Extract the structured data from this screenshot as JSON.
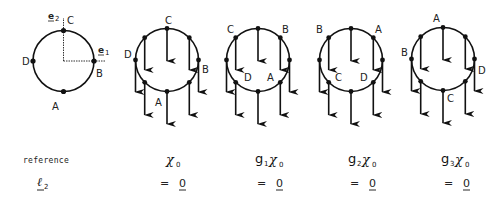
{
  "reference_diagram": {
    "labels": {
      "top": "C",
      "right": "B",
      "bottom": "A",
      "left": "D"
    },
    "axes": {
      "e1": "e",
      "e1_sub": "1",
      "e2": "e",
      "e2_sub": "2"
    }
  },
  "configurations": [
    {
      "id": "x0",
      "labels": {
        "top": "C",
        "right": "B",
        "bottom": "A",
        "left": "D"
      },
      "caption_main": "χ",
      "caption_g": "",
      "caption_g_sub": "",
      "caption_sub": "0"
    },
    {
      "id": "g1x0",
      "labels": {
        "upper_left": "C",
        "upper_right": "B",
        "lower_left": "D",
        "lower_right": "A"
      },
      "caption_main": "χ",
      "caption_g": "g",
      "caption_g_sub": "1",
      "caption_sub": "0"
    },
    {
      "id": "g2x0",
      "labels": {
        "upper_left": "B",
        "upper_right": "A",
        "lower_left": "C",
        "lower_right": "D"
      },
      "caption_main": "χ",
      "caption_g": "g",
      "caption_g_sub": "2",
      "caption_sub": "0"
    },
    {
      "id": "g3x0",
      "labels": {
        "top": "A",
        "left": "B",
        "right": "D",
        "bottom": "C"
      },
      "caption_main": "χ",
      "caption_g": "g",
      "caption_g_sub": "3",
      "caption_sub": "0"
    }
  ],
  "rows": {
    "reference_label": "reference",
    "l2_label": "ℓ",
    "l2_sub": "2",
    "equals": "=",
    "zero": "0"
  },
  "colors": {
    "ink": "#111111",
    "background": "#ffffff"
  }
}
